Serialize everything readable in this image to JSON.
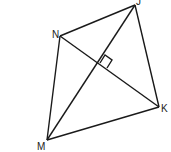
{
  "diagram": {
    "type": "kite-quadrilateral",
    "vertices": [
      {
        "label": "J",
        "x": 135,
        "y": 5
      },
      {
        "label": "K",
        "x": 159,
        "y": 107
      },
      {
        "label": "M",
        "x": 47,
        "y": 140
      },
      {
        "label": "N",
        "x": 60,
        "y": 36
      }
    ],
    "diagonals": [
      [
        "J",
        "M"
      ],
      [
        "N",
        "K"
      ]
    ],
    "annotations": [
      "right-angle marker at diagonal intersection"
    ],
    "stroke_color": "#1a1a1a"
  }
}
